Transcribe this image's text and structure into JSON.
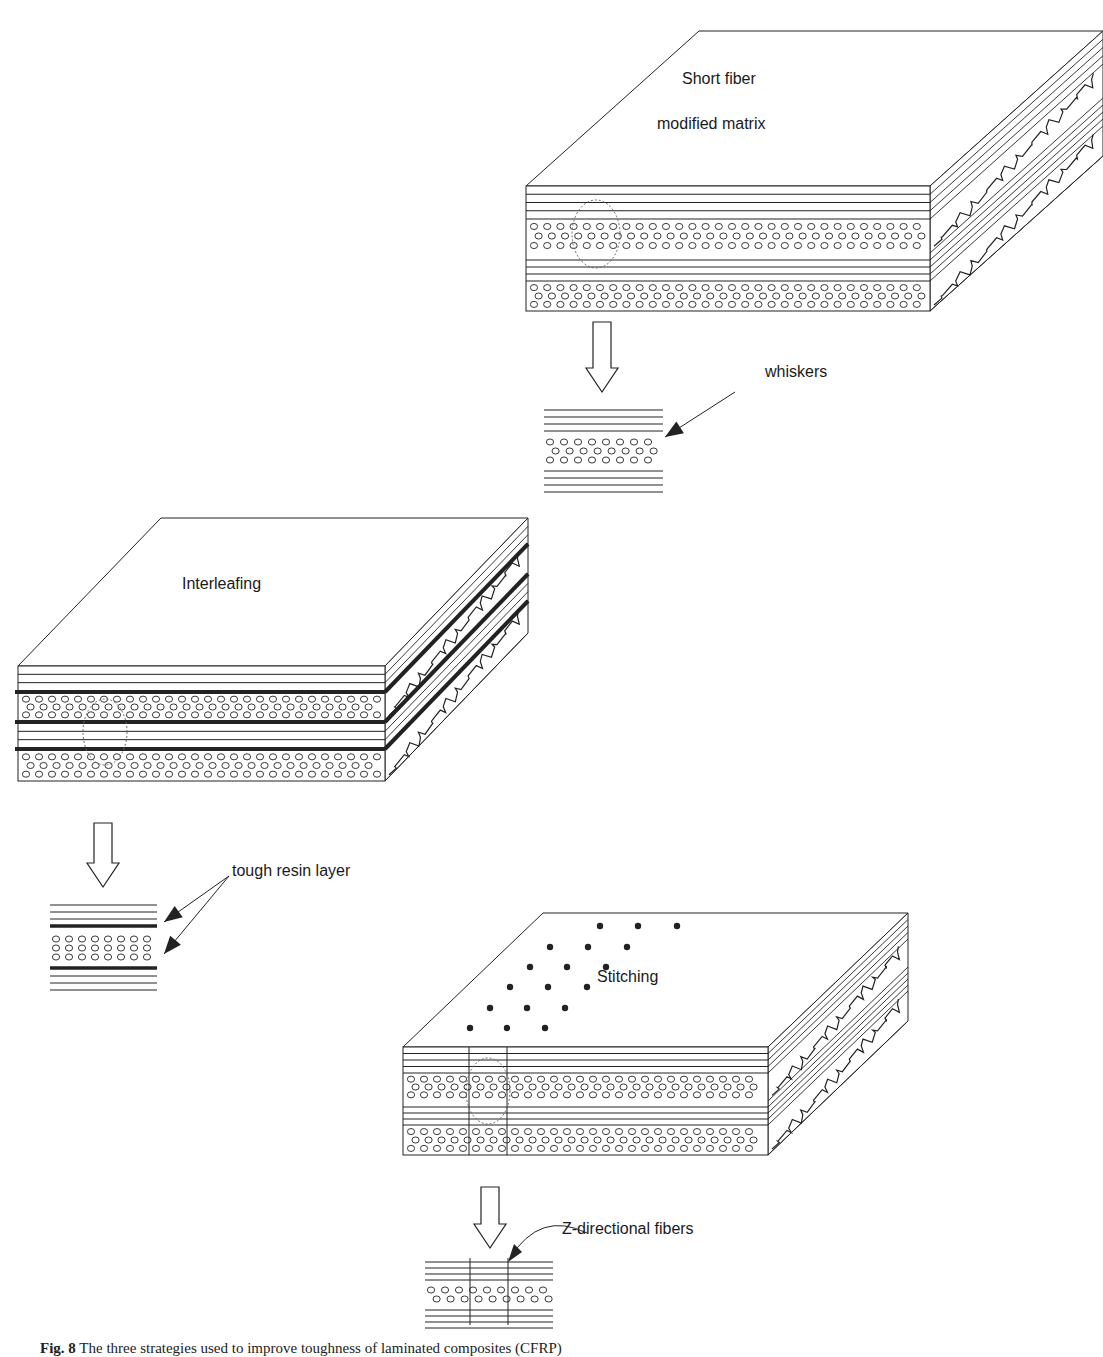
{
  "figure": {
    "caption_label": "Fig. 8",
    "caption_text": "The three strategies used to improve toughness of laminated composites (CFRP)",
    "panels": [
      {
        "id": "short-fiber",
        "block_title_line1": "Short fiber",
        "block_title_line2": "modified matrix",
        "callout": "whiskers"
      },
      {
        "id": "interleafing",
        "block_title": "Interleafing",
        "callout": "tough resin layer"
      },
      {
        "id": "stitching",
        "block_title": "Stitching",
        "callout": "Z-directional fibers"
      }
    ]
  },
  "colors": {
    "line": "#222222",
    "background": "#ffffff"
  }
}
